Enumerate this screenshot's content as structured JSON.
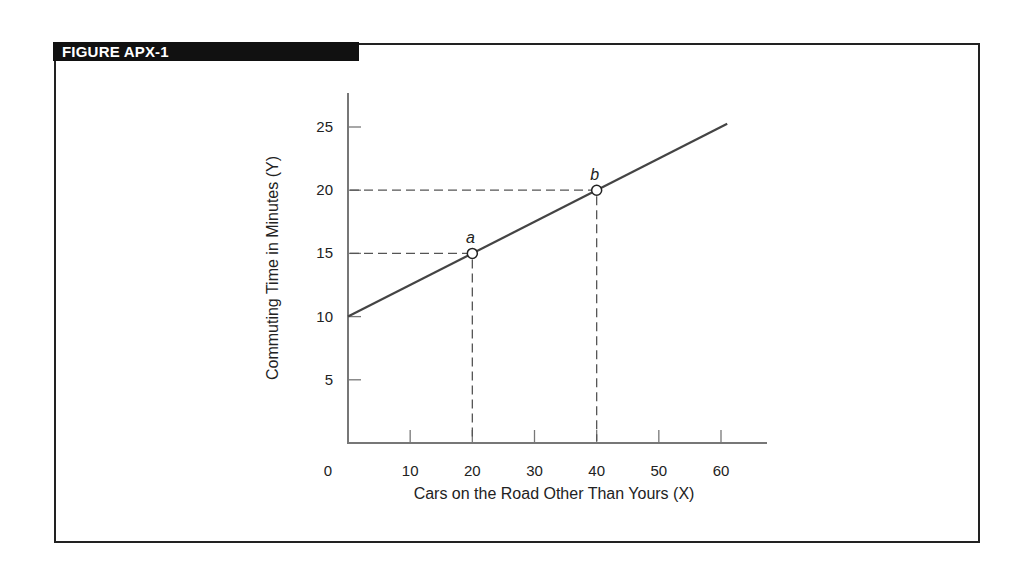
{
  "figure": {
    "title": "FIGURE APX-1"
  },
  "chart_data": {
    "type": "line",
    "title": "FIGURE APX-1",
    "xlabel": "Cars on the Road Other Than Yours (X)",
    "ylabel": "Commuting Time in Minutes (Y)",
    "x_ticks": [
      10,
      20,
      30,
      40,
      50,
      60
    ],
    "y_ticks": [
      5,
      10,
      15,
      20,
      25
    ],
    "origin_label": "0",
    "xlim": [
      0,
      67
    ],
    "ylim": [
      0,
      27.5
    ],
    "grid": false,
    "legend": null,
    "series": [
      {
        "name": "Commuting time",
        "x": [
          0,
          61
        ],
        "y": [
          10,
          25.25
        ],
        "equation": "Y = 10 + 0.25X"
      }
    ],
    "points": [
      {
        "label": "a",
        "x": 20,
        "y": 15
      },
      {
        "label": "b",
        "x": 40,
        "y": 20
      }
    ],
    "annotations": "Dashed guide lines connect points a and b to both axes"
  },
  "colors": {
    "frame": "#222222",
    "title_bg": "#111111",
    "title_text": "#ffffff",
    "axis": "#777777",
    "line": "#444444",
    "dash": "#555555"
  }
}
